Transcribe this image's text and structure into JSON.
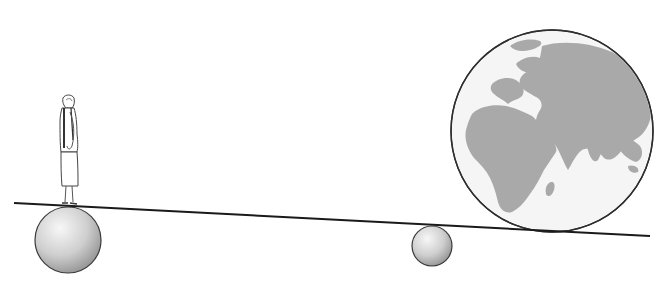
{
  "illustration": {
    "description": "Seesaw-like lever: a standing person on a large sphere on the left, a small fulcrum sphere in the middle, and a globe of the Earth on the right",
    "colors": {
      "background": "#ffffff",
      "outline": "#333333",
      "lever": "#1a1a1a",
      "sphere_light": "#f2f2f2",
      "sphere_dark": "#9a9a9a",
      "ocean": "#f4f4f4",
      "land": "#a8a8a8"
    },
    "elements": {
      "lever": {
        "x1": 14,
        "y1": 203,
        "x2": 650,
        "y2": 236
      },
      "left_sphere": {
        "cx": 68,
        "cy": 240,
        "r": 33
      },
      "fulcrum_sphere": {
        "cx": 432,
        "cy": 246,
        "r": 20
      },
      "globe": {
        "cx": 552,
        "cy": 131,
        "r": 101
      },
      "person": {
        "feet_x": 66,
        "feet_y": 205,
        "height": 112
      }
    }
  }
}
